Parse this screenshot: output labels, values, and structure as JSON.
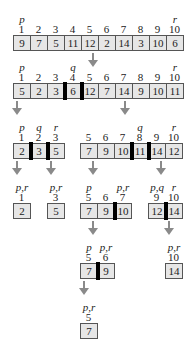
{
  "cell_width": 17,
  "arrays": [
    {
      "id": "root",
      "x": 13,
      "y": 35,
      "indices": [
        "1",
        "2",
        "3",
        "4",
        "5",
        "6",
        "7",
        "8",
        "9",
        "10"
      ],
      "values": [
        "9",
        "7",
        "5",
        "11",
        "12",
        "2",
        "14",
        "3",
        "10",
        "6"
      ],
      "labels": [
        {
          "at": 0,
          "text": "p"
        },
        {
          "at": 9,
          "text": "r"
        }
      ],
      "bars": []
    },
    {
      "id": "partitioned",
      "x": 13,
      "y": 83,
      "indices": [
        "1",
        "2",
        "3",
        "4",
        "5",
        "6",
        "7",
        "8",
        "9",
        "10"
      ],
      "values": [
        "5",
        "2",
        "3",
        "6",
        "12",
        "7",
        "14",
        "9",
        "10",
        "11"
      ],
      "labels": [
        {
          "at": 0,
          "text": "p"
        },
        {
          "at": 3,
          "text": "q"
        },
        {
          "at": 9,
          "text": "r"
        }
      ],
      "bars": [
        3,
        4
      ]
    },
    {
      "id": "left-1-3",
      "x": 13,
      "y": 143,
      "indices": [
        "1",
        "2",
        "3"
      ],
      "values": [
        "2",
        "3",
        "5"
      ],
      "labels": [
        {
          "at": 0,
          "text": "p"
        },
        {
          "at": 1,
          "text": "q"
        },
        {
          "at": 2,
          "text": "r"
        }
      ],
      "bars": [
        1,
        2
      ]
    },
    {
      "id": "right-5-10",
      "x": 80,
      "y": 143,
      "indices": [
        "5",
        "6",
        "7",
        "8",
        "9",
        "10"
      ],
      "values": [
        "7",
        "9",
        "10",
        "11",
        "14",
        "12"
      ],
      "labels": [
        {
          "at": 3,
          "text": "q"
        },
        {
          "at": 5,
          "text": "r"
        }
      ],
      "bars": [
        3,
        4
      ]
    },
    {
      "id": "leaf-1",
      "x": 13,
      "y": 203,
      "indices": [
        "1"
      ],
      "values": [
        "2"
      ],
      "labels": [
        {
          "at": 0,
          "text": "p,r"
        }
      ],
      "bars": []
    },
    {
      "id": "leaf-3",
      "x": 47,
      "y": 203,
      "indices": [
        "3"
      ],
      "values": [
        "5"
      ],
      "labels": [
        {
          "at": 0,
          "text": "p,r"
        }
      ],
      "bars": []
    },
    {
      "id": "sub-5-7",
      "x": 80,
      "y": 203,
      "indices": [
        "5",
        "6",
        "7"
      ],
      "values": [
        "7",
        "9",
        "10"
      ],
      "labels": [
        {
          "at": 0,
          "text": "p"
        },
        {
          "at": 2,
          "text": "p,r"
        }
      ],
      "bars": [
        2
      ]
    },
    {
      "id": "sub-9-10",
      "x": 148,
      "y": 203,
      "indices": [
        "9",
        "10"
      ],
      "values": [
        "12",
        "14"
      ],
      "labels": [
        {
          "at": 0,
          "text": "p,q"
        },
        {
          "at": 1,
          "text": "r"
        }
      ],
      "bars": [
        1
      ]
    },
    {
      "id": "sub-5-6",
      "x": 80,
      "y": 263,
      "indices": [
        "5",
        "6"
      ],
      "values": [
        "7",
        "9"
      ],
      "labels": [
        {
          "at": 0,
          "text": "p"
        },
        {
          "at": 1,
          "text": "p,r"
        }
      ],
      "bars": [
        1
      ]
    },
    {
      "id": "leaf-10",
      "x": 165,
      "y": 263,
      "indices": [
        "10"
      ],
      "values": [
        "14"
      ],
      "labels": [
        {
          "at": 0,
          "text": "p,r"
        }
      ],
      "bars": []
    },
    {
      "id": "leaf-5",
      "x": 80,
      "y": 323,
      "indices": [
        "5"
      ],
      "values": [
        "7"
      ],
      "labels": [
        {
          "at": 0,
          "text": "p,r"
        }
      ],
      "bars": []
    }
  ],
  "arrows": [
    {
      "x": 93,
      "y": 53,
      "len": 14
    },
    {
      "x": 17,
      "y": 101,
      "len": 14
    },
    {
      "x": 125,
      "y": 101,
      "len": 14
    },
    {
      "x": 17,
      "y": 161,
      "len": 14
    },
    {
      "x": 51,
      "y": 161,
      "len": 14
    },
    {
      "x": 93,
      "y": 161,
      "len": 14
    },
    {
      "x": 161,
      "y": 161,
      "len": 14
    },
    {
      "x": 93,
      "y": 221,
      "len": 14
    },
    {
      "x": 169,
      "y": 221,
      "len": 14
    },
    {
      "x": 84,
      "y": 281,
      "len": 14
    }
  ]
}
